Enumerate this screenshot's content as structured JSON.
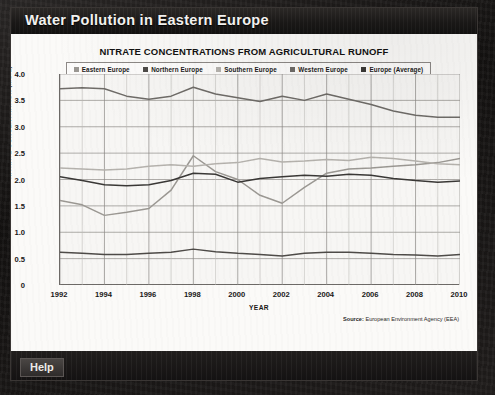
{
  "window": {
    "title": "Water Pollution in Eastern Europe",
    "help_label": "Help"
  },
  "chart_data": {
    "type": "line",
    "title": "NITRATE CONCENTRATIONS FROM AGRICULTURAL RUNOFF",
    "xlabel": "YEAR",
    "ylabel": "NITRATE CONCENTRATION (MG/L)",
    "source": "Source: European Environment Agency (EEA)",
    "source_prefix": "Source:",
    "source_body": "European Environment Agency (EEA)",
    "grid": true,
    "legend_position": "top",
    "xlim": [
      1992,
      2010
    ],
    "ylim": [
      0,
      4.0
    ],
    "yticks": [
      "4.0",
      "3.5",
      "3.0",
      "2.5",
      "2.0",
      "1.5",
      "1.0",
      "0.5",
      "0"
    ],
    "ytick_values": [
      4.0,
      3.5,
      3.0,
      2.5,
      2.0,
      1.5,
      1.0,
      0.5,
      0
    ],
    "xticks": [
      "1992",
      "1994",
      "1996",
      "1998",
      "2000",
      "2002",
      "2004",
      "2006",
      "2008",
      "2010"
    ],
    "x": [
      1992,
      1993,
      1994,
      1995,
      1996,
      1997,
      1998,
      1999,
      2000,
      2001,
      2002,
      2003,
      2004,
      2005,
      2006,
      2007,
      2008,
      2009,
      2010
    ],
    "series": [
      {
        "name": "Eastern Europe",
        "color": "#9b9893",
        "values": [
          1.6,
          1.52,
          1.32,
          1.38,
          1.45,
          1.8,
          2.45,
          2.15,
          2.0,
          1.7,
          1.55,
          1.85,
          2.12,
          2.2,
          2.22,
          2.25,
          2.28,
          2.32,
          2.4
        ]
      },
      {
        "name": "Northern Europe",
        "color": "#4e4b48",
        "values": [
          0.62,
          0.6,
          0.58,
          0.58,
          0.6,
          0.62,
          0.68,
          0.63,
          0.6,
          0.58,
          0.55,
          0.6,
          0.62,
          0.62,
          0.6,
          0.58,
          0.57,
          0.55,
          0.58
        ]
      },
      {
        "name": "Southern Europe",
        "color": "#b5b2ad",
        "values": [
          2.22,
          2.2,
          2.18,
          2.2,
          2.25,
          2.28,
          2.25,
          2.3,
          2.32,
          2.4,
          2.33,
          2.35,
          2.38,
          2.36,
          2.42,
          2.4,
          2.35,
          2.3,
          2.28
        ]
      },
      {
        "name": "Western Europe",
        "color": "#6f6c68",
        "values": [
          3.72,
          3.74,
          3.72,
          3.58,
          3.52,
          3.58,
          3.75,
          3.62,
          3.55,
          3.48,
          3.58,
          3.5,
          3.62,
          3.52,
          3.42,
          3.3,
          3.22,
          3.18,
          3.18
        ]
      },
      {
        "name": "Europe (Average)",
        "color": "#3a3836",
        "values": [
          2.05,
          1.98,
          1.9,
          1.88,
          1.9,
          1.98,
          2.12,
          2.1,
          1.95,
          2.02,
          2.05,
          2.08,
          2.06,
          2.1,
          2.08,
          2.02,
          1.98,
          1.95,
          1.97
        ]
      }
    ]
  }
}
